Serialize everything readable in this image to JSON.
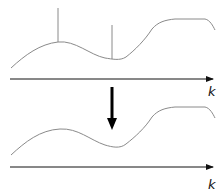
{
  "diagram": {
    "top_panel": {
      "axis_label": "k",
      "spikes": [
        {
          "x": 58,
          "y_top": 8,
          "y_base": 42
        },
        {
          "x": 112,
          "y_top": 25,
          "y_base": 59
        }
      ]
    },
    "transform_arrow": {
      "direction": "down"
    },
    "bottom_panel": {
      "axis_label": "k"
    },
    "colors": {
      "curve": "#8a8a8a",
      "axis": "#111111",
      "arrow": "#000000"
    }
  }
}
